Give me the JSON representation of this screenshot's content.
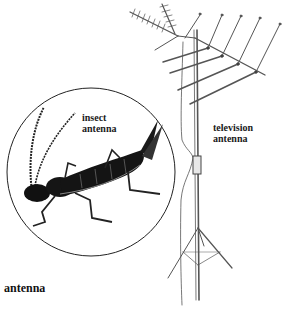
{
  "figure": {
    "headword": "antenna",
    "labels": {
      "insect": [
        "insect",
        "antenna"
      ],
      "television": [
        "television",
        "antenna"
      ]
    },
    "colors": {
      "ink": "#1a1a1a",
      "line": "#555555",
      "background": "#ffffff"
    }
  }
}
